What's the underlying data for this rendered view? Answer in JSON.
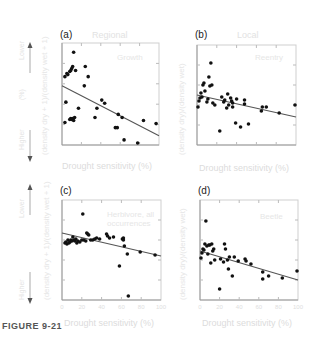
{
  "figure": {
    "caption": "FIGURE 9-21"
  },
  "side_labels": {
    "top": "Lower",
    "middle": "(%)",
    "bottom": "Higher"
  },
  "chart_data": [
    {
      "id": "a",
      "type": "scatter",
      "panel_label": "(a)",
      "title": "Regional",
      "note": "Growth",
      "xlabel": "Drought sensitivity (%)",
      "ylabel": "(density dry + 1)/(density wet + 1)",
      "xlim": [
        0,
        100
      ],
      "ylim": [
        0,
        100
      ],
      "points": [
        [
          3,
          67
        ],
        [
          4,
          42
        ],
        [
          3,
          22
        ],
        [
          5,
          70
        ],
        [
          6,
          69
        ],
        [
          8,
          72
        ],
        [
          9,
          73
        ],
        [
          10,
          75
        ],
        [
          11,
          77
        ],
        [
          12,
          91
        ],
        [
          14,
          73
        ],
        [
          8,
          25
        ],
        [
          9,
          26
        ],
        [
          10,
          25
        ],
        [
          11,
          26
        ],
        [
          12,
          24
        ],
        [
          13,
          27
        ],
        [
          17,
          36
        ],
        [
          23,
          58
        ],
        [
          24,
          77
        ],
        [
          27,
          67
        ],
        [
          34,
          27
        ],
        [
          36,
          36
        ],
        [
          41,
          44
        ],
        [
          44,
          41
        ],
        [
          55,
          17
        ],
        [
          57,
          17
        ],
        [
          58,
          30
        ],
        [
          62,
          27
        ],
        [
          64,
          5
        ],
        [
          78,
          2
        ],
        [
          84,
          24
        ],
        [
          97,
          21
        ]
      ],
      "trend": {
        "x0": 0,
        "y0": 58,
        "x1": 100,
        "y1": 9
      }
    },
    {
      "id": "b",
      "type": "scatter",
      "panel_label": "(b)",
      "title": "Local",
      "note": "Reentry",
      "xlabel": "Drought sensitivity (%)",
      "ylabel": "(density dry)/(density wet)",
      "xlim": [
        0,
        100
      ],
      "ylim": [
        0,
        100
      ],
      "points": [
        [
          1,
          38
        ],
        [
          2,
          44
        ],
        [
          3,
          47
        ],
        [
          4,
          52
        ],
        [
          5,
          48
        ],
        [
          6,
          60
        ],
        [
          7,
          62
        ],
        [
          8,
          54
        ],
        [
          10,
          43
        ],
        [
          11,
          46
        ],
        [
          12,
          68
        ],
        [
          13,
          59
        ],
        [
          14,
          82
        ],
        [
          15,
          60
        ],
        [
          16,
          42
        ],
        [
          18,
          40
        ],
        [
          23,
          14
        ],
        [
          25,
          48
        ],
        [
          27,
          43
        ],
        [
          28,
          45
        ],
        [
          30,
          37
        ],
        [
          31,
          51
        ],
        [
          32,
          40
        ],
        [
          34,
          47
        ],
        [
          35,
          44
        ],
        [
          36,
          42
        ],
        [
          36,
          38
        ],
        [
          39,
          22
        ],
        [
          40,
          46
        ],
        [
          44,
          18
        ],
        [
          48,
          45
        ],
        [
          48,
          41
        ],
        [
          52,
          21
        ],
        [
          65,
          34
        ],
        [
          66,
          38
        ],
        [
          70,
          38
        ],
        [
          83,
          32
        ],
        [
          99,
          40
        ]
      ],
      "trend": {
        "x0": 0,
        "y0": 50,
        "x1": 100,
        "y1": 28
      }
    },
    {
      "id": "c",
      "type": "scatter",
      "panel_label": "(c)",
      "title": "",
      "note": "Herbivore, all occurrences",
      "xlabel": "Drought sensitivity (%)",
      "ylabel": "(density dry + 1)/(density wet + 1)",
      "xlim": [
        0,
        100
      ],
      "ylim": [
        0,
        100
      ],
      "xticks": [
        "0",
        "20",
        "40",
        "60",
        "80",
        "100"
      ],
      "points": [
        [
          3,
          57
        ],
        [
          4,
          58
        ],
        [
          5,
          56
        ],
        [
          6,
          60
        ],
        [
          7,
          57
        ],
        [
          8,
          58
        ],
        [
          9,
          60
        ],
        [
          10,
          59
        ],
        [
          11,
          63
        ],
        [
          12,
          60
        ],
        [
          13,
          59
        ],
        [
          14,
          61
        ],
        [
          15,
          57
        ],
        [
          16,
          59
        ],
        [
          18,
          58
        ],
        [
          20,
          60
        ],
        [
          21,
          86
        ],
        [
          22,
          60
        ],
        [
          24,
          59
        ],
        [
          25,
          67
        ],
        [
          26,
          66
        ],
        [
          27,
          65
        ],
        [
          29,
          60
        ],
        [
          31,
          60
        ],
        [
          33,
          61
        ],
        [
          35,
          62
        ],
        [
          38,
          61
        ],
        [
          45,
          66
        ],
        [
          46,
          64
        ],
        [
          48,
          62
        ],
        [
          52,
          63
        ],
        [
          58,
          34
        ],
        [
          61,
          61
        ],
        [
          62,
          60
        ],
        [
          62,
          62
        ],
        [
          63,
          54
        ],
        [
          66,
          46
        ],
        [
          67,
          4
        ],
        [
          79,
          48
        ],
        [
          94,
          45
        ]
      ],
      "trend": {
        "x0": 0,
        "y0": 67,
        "x1": 100,
        "y1": 44
      }
    },
    {
      "id": "d",
      "type": "scatter",
      "panel_label": "(d)",
      "title": "",
      "note": "Beetle",
      "xlabel": "Drought sensitivity (%)",
      "ylabel": "(density dry)/(density wet)",
      "xlim": [
        0,
        100
      ],
      "ylim": [
        0,
        100
      ],
      "xticks": [
        "0",
        "20",
        "40",
        "60",
        "80",
        "100"
      ],
      "points": [
        [
          1,
          42
        ],
        [
          2,
          47
        ],
        [
          3,
          51
        ],
        [
          4,
          50
        ],
        [
          5,
          56
        ],
        [
          6,
          79
        ],
        [
          7,
          54
        ],
        [
          8,
          46
        ],
        [
          9,
          55
        ],
        [
          10,
          55
        ],
        [
          11,
          37
        ],
        [
          12,
          56
        ],
        [
          13,
          49
        ],
        [
          14,
          51
        ],
        [
          15,
          40
        ],
        [
          20,
          11
        ],
        [
          21,
          41
        ],
        [
          24,
          38
        ],
        [
          25,
          56
        ],
        [
          26,
          51
        ],
        [
          28,
          40
        ],
        [
          29,
          31
        ],
        [
          30,
          43
        ],
        [
          33,
          24
        ],
        [
          35,
          43
        ],
        [
          39,
          39
        ],
        [
          46,
          41
        ],
        [
          47,
          39
        ],
        [
          52,
          36
        ],
        [
          64,
          28
        ],
        [
          64,
          21
        ],
        [
          70,
          24
        ],
        [
          84,
          22
        ],
        [
          99,
          29
        ]
      ],
      "trend": {
        "x0": 0,
        "y0": 49,
        "x1": 100,
        "y1": 20
      }
    }
  ]
}
